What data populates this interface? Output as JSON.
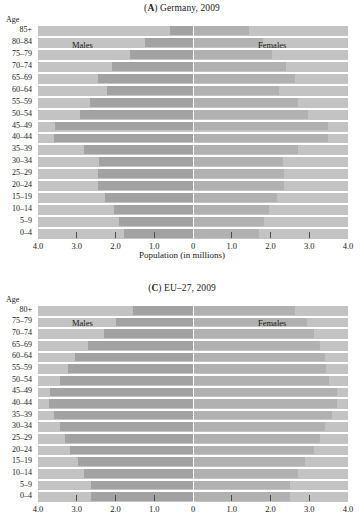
{
  "figure": {
    "axis_label_age": "Age",
    "male_label": "Males",
    "female_label": "Females"
  },
  "chart_data": [
    {
      "id": "A",
      "type": "bar",
      "orientation": "horizontal",
      "subtype": "population-pyramid",
      "title": "(A) Germany, 2009",
      "title_prefix": "A",
      "title_rest": ") Germany, 2009",
      "title_open": "(",
      "xlabel": "Population (in millions)",
      "ylabel": "Age",
      "xlim": [
        -4.0,
        4.0
      ],
      "xticks": [
        4.0,
        3.0,
        2.0,
        1.0,
        0,
        1.0,
        2.0,
        3.0,
        4.0
      ],
      "xticklabels": [
        "4.0",
        "3.0",
        "2.0",
        "1.0",
        "0",
        "1.0",
        "2.0",
        "3.0",
        "4.0"
      ],
      "grid": false,
      "legend": [
        "Males",
        "Females"
      ],
      "legend_position": "inside-top",
      "categories": [
        "85+",
        "80–84",
        "75–79",
        "70–74",
        "65–69",
        "60–64",
        "55–59",
        "50–54",
        "45–49",
        "40–44",
        "35–39",
        "30–34",
        "25–29",
        "20–24",
        "15–19",
        "10–14",
        "5–9",
        "0–4"
      ],
      "series": [
        {
          "name": "Males",
          "values": [
            0.6,
            1.25,
            1.63,
            2.1,
            2.45,
            2.22,
            2.65,
            2.92,
            3.55,
            3.6,
            2.82,
            2.42,
            2.45,
            2.45,
            2.28,
            2.05,
            1.92,
            1.78
          ]
        },
        {
          "name": "Females",
          "values": [
            1.45,
            1.8,
            2.05,
            2.4,
            2.63,
            2.22,
            2.72,
            2.98,
            3.48,
            3.48,
            2.7,
            2.32,
            2.36,
            2.36,
            2.18,
            1.95,
            1.82,
            1.7
          ]
        }
      ]
    },
    {
      "id": "C",
      "type": "bar",
      "orientation": "horizontal",
      "subtype": "population-pyramid",
      "title": "(C) EU–27, 2009",
      "title_prefix": "C",
      "title_rest": ") EU–27, 2009",
      "title_open": "(",
      "xlabel": "",
      "ylabel": "Age",
      "xlim": [
        -4.0,
        4.0
      ],
      "xticks": [
        4.0,
        3.0,
        2.0,
        1.0,
        0,
        1.0,
        2.0,
        3.0,
        4.0
      ],
      "xticklabels": [
        "4.0",
        "3.0",
        "2.0",
        "1.0",
        "0",
        "1.0",
        "2.0",
        "3.0",
        "4.0"
      ],
      "grid": false,
      "legend": [
        "Males",
        "Females"
      ],
      "legend_position": "inside-top",
      "categories": [
        "80+",
        "75–79",
        "70–74",
        "65–69",
        "60–64",
        "55–59",
        "50–54",
        "45–49",
        "40–44",
        "35–39",
        "30–34",
        "25–29",
        "20–24",
        "15–19",
        "10–14",
        "5–9",
        "0–4"
      ],
      "series": [
        {
          "name": "Males",
          "values": [
            1.55,
            2.0,
            2.3,
            2.72,
            3.05,
            3.22,
            3.42,
            3.7,
            3.72,
            3.6,
            3.42,
            3.3,
            3.18,
            2.98,
            2.82,
            2.62,
            2.62
          ]
        },
        {
          "name": "Females",
          "values": [
            2.62,
            2.95,
            3.12,
            3.28,
            3.4,
            3.42,
            3.52,
            3.72,
            3.72,
            3.58,
            3.4,
            3.28,
            3.12,
            2.9,
            2.7,
            2.5,
            2.5
          ]
        }
      ]
    }
  ]
}
